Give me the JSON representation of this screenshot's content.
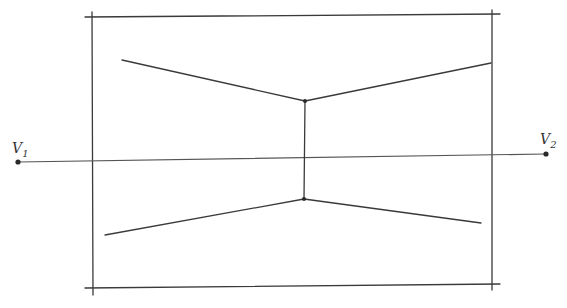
{
  "diagram": {
    "type": "two-point perspective sketch",
    "style": "hand-drawn pencil lines",
    "colors": {
      "background": "#ffffff",
      "line": "#3a3a3a"
    },
    "vanishing_points": [
      {
        "id": "v1",
        "label": "V",
        "subscript": "1",
        "x": 18,
        "y": 162
      },
      {
        "id": "v2",
        "label": "V",
        "subscript": "2",
        "x": 546,
        "y": 154
      }
    ],
    "horizon_line": {
      "x1": 18,
      "y1": 162,
      "x2": 546,
      "y2": 154
    },
    "frame": {
      "top": {
        "x1": 85,
        "y1": 17,
        "x2": 500,
        "y2": 14
      },
      "bottom": {
        "x1": 85,
        "y1": 288,
        "x2": 500,
        "y2": 284
      },
      "left": {
        "x1": 92,
        "y1": 12,
        "x2": 93,
        "y2": 295
      },
      "right": {
        "x1": 492,
        "y1": 10,
        "x2": 492,
        "y2": 290
      }
    },
    "vertical_edge": {
      "x1": 305,
      "y1": 101,
      "x2": 304,
      "y2": 199
    },
    "converging_lines": [
      {
        "name": "upper-left-line",
        "x1": 122,
        "y1": 60,
        "x2": 305,
        "y2": 101
      },
      {
        "name": "upper-right-line",
        "x1": 305,
        "y1": 101,
        "x2": 491,
        "y2": 63
      },
      {
        "name": "lower-left-line",
        "x1": 105,
        "y1": 235,
        "x2": 304,
        "y2": 199
      },
      {
        "name": "lower-right-line",
        "x1": 304,
        "y1": 199,
        "x2": 481,
        "y2": 223
      }
    ]
  }
}
